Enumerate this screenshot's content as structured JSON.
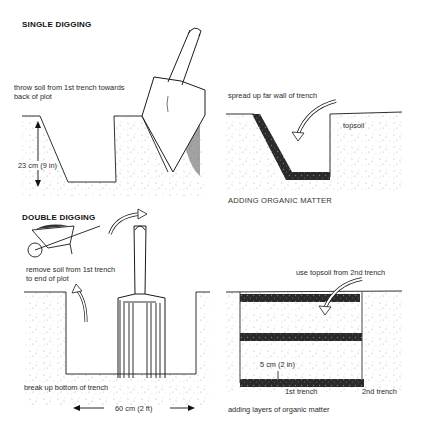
{
  "panels": {
    "single_digging": {
      "title": "SINGLE DIGGING",
      "instruction": [
        "throw soil from 1st trench towards",
        "back of plot"
      ],
      "measurement": "23 cm (9 in)"
    },
    "adding_organic": {
      "instruction": "spread up far wall of trench",
      "soil_label": "topsoil",
      "caption": "ADDING ORGANIC MATTER"
    },
    "double_digging": {
      "title": "DOUBLE DIGGING",
      "instruction": [
        "remove soil from 1st trench",
        "to end of plot"
      ],
      "bottom_label": "break up bottom of trench",
      "measurement": "60 cm (2 ft)"
    },
    "layers": {
      "instruction": "use topsoil from 2nd trench",
      "measurement": "5 cm (2 in)",
      "trench1_label": "1st trench",
      "trench2_label": "2nd trench",
      "caption": "adding layers of organic matter"
    }
  },
  "colors": {
    "ink": "#1a1a1a",
    "soil_speckle": "#8a8a8a",
    "organic": "#222222",
    "background": "#ffffff"
  }
}
